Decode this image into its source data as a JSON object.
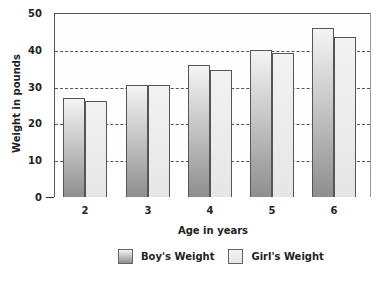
{
  "chart_data": {
    "type": "bar",
    "title": "",
    "xlabel": "Age in years",
    "ylabel": "Weight in pounds",
    "categories": [
      "2",
      "3",
      "4",
      "5",
      "6"
    ],
    "series": [
      {
        "name": "Boy's Weight",
        "values": [
          27,
          30.5,
          36,
          40,
          46
        ]
      },
      {
        "name": "Girl's Weight",
        "values": [
          26,
          30.5,
          34.5,
          39,
          43.5
        ]
      }
    ],
    "ylim": [
      0,
      50
    ],
    "yticks": [
      "0",
      "10",
      "20",
      "30",
      "40",
      "50"
    ],
    "grid": true,
    "legend_position": "bottom"
  },
  "colors": {
    "boy": "#9a9a9a",
    "girl": "#ececec"
  }
}
